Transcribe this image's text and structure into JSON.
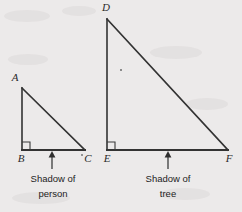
{
  "figure": {
    "background_color": "#eceaea",
    "line_color": "#333333",
    "text_color": "#232323"
  },
  "triangles": [
    {
      "id": "person",
      "name": "person-triangle",
      "vertices": {
        "apex": {
          "label": "A",
          "x": 22,
          "y": 88
        },
        "right_angle": {
          "label": "B",
          "x": 22,
          "y": 150
        },
        "base_end": {
          "label": "C",
          "x": 85,
          "y": 150
        }
      },
      "right_angle_marker": {
        "x": 22,
        "y": 150,
        "size": 8
      },
      "caption": {
        "line1": "Shadow of",
        "line2": "person"
      },
      "arrow": {
        "x": 52,
        "tip_y": 152,
        "tail_y": 169
      }
    },
    {
      "id": "tree",
      "name": "tree-triangle",
      "vertices": {
        "apex": {
          "label": "D",
          "x": 107,
          "y": 19
        },
        "right_angle": {
          "label": "E",
          "x": 107,
          "y": 150
        },
        "base_end": {
          "label": "F",
          "x": 228,
          "y": 150
        }
      },
      "right_angle_marker": {
        "x": 107,
        "y": 150,
        "size": 8
      },
      "caption": {
        "line1": "Shadow of",
        "line2": "tree"
      },
      "arrow": {
        "x": 168,
        "tip_y": 152,
        "tail_y": 169
      }
    }
  ],
  "labels": {
    "A": "A",
    "B": "B",
    "C": "C",
    "D": "D",
    "E": "E",
    "F": "F",
    "shadow_of_1": "Shadow of",
    "person": "person",
    "shadow_of_2": "Shadow of",
    "tree": "tree"
  }
}
